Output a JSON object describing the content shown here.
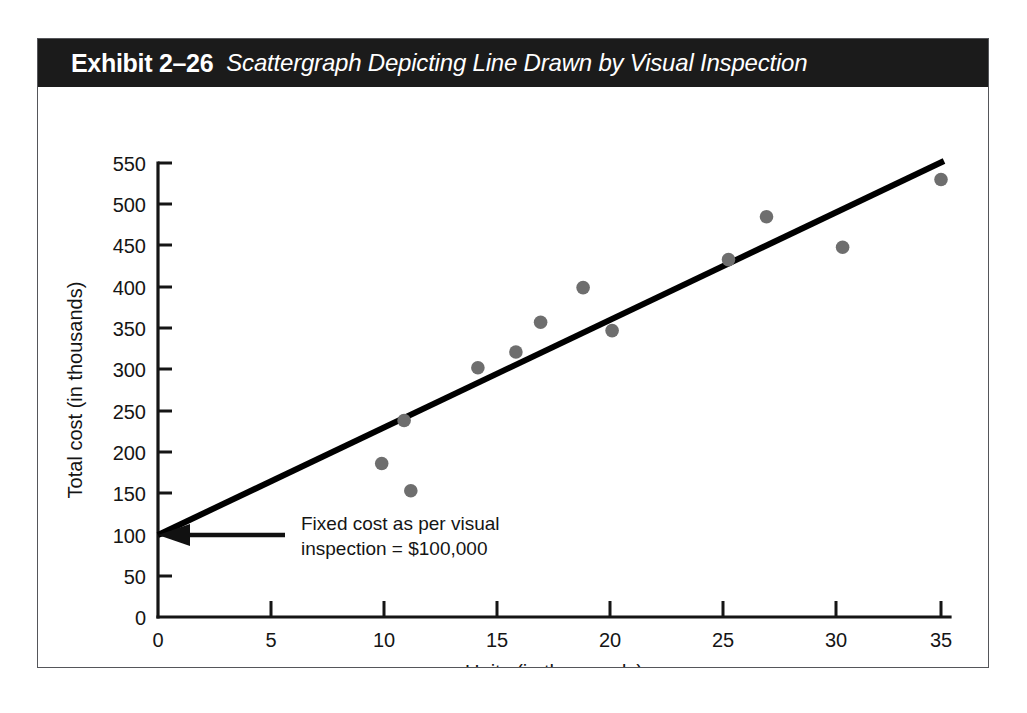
{
  "exhibit": {
    "number": "Exhibit 2–26",
    "caption": "Scattergraph Depicting Line Drawn by Visual Inspection"
  },
  "chart_data": {
    "type": "scatter",
    "title": "Scattergraph Depicting Line Drawn by Visual Inspection",
    "xlabel": "Units (in thousands)",
    "ylabel": "Total cost (in thousands)",
    "xlim": [
      0,
      35
    ],
    "ylim": [
      0,
      550
    ],
    "xticks": [
      0,
      5,
      10,
      15,
      20,
      25,
      30,
      35
    ],
    "yticks": [
      0,
      50,
      100,
      150,
      200,
      250,
      300,
      350,
      400,
      450,
      500,
      550
    ],
    "xtick_labels": [
      "0",
      "5",
      "10",
      "15",
      "20",
      "25",
      "30",
      "35"
    ],
    "ytick_labels": [
      "0",
      "50",
      "100",
      "150",
      "200",
      "250",
      "300",
      "350",
      "400",
      "450",
      "500",
      "550"
    ],
    "grid": false,
    "legend": false,
    "marker_color": "#6e6e6e",
    "line_color": "#000000",
    "series": [
      {
        "name": "Observed cost points",
        "type": "scatter",
        "points": [
          {
            "x": 10.0,
            "y": 186
          },
          {
            "x": 11.0,
            "y": 238
          },
          {
            "x": 11.3,
            "y": 153
          },
          {
            "x": 14.3,
            "y": 302
          },
          {
            "x": 16.0,
            "y": 321
          },
          {
            "x": 17.1,
            "y": 357
          },
          {
            "x": 19.0,
            "y": 399
          },
          {
            "x": 20.3,
            "y": 347
          },
          {
            "x": 25.5,
            "y": 433
          },
          {
            "x": 27.2,
            "y": 485
          },
          {
            "x": 30.6,
            "y": 448
          },
          {
            "x": 35.0,
            "y": 530
          }
        ]
      },
      {
        "name": "Line drawn by visual inspection",
        "type": "line",
        "points": [
          {
            "x": 0,
            "y": 100
          },
          {
            "x": 35.1,
            "y": 553
          }
        ]
      }
    ],
    "annotations": [
      {
        "name": "fixed-cost-callout",
        "line1": "Fixed cost as per visual",
        "line2": "inspection = $100,000",
        "points_to": {
          "x": 0,
          "y": 100
        }
      }
    ]
  }
}
